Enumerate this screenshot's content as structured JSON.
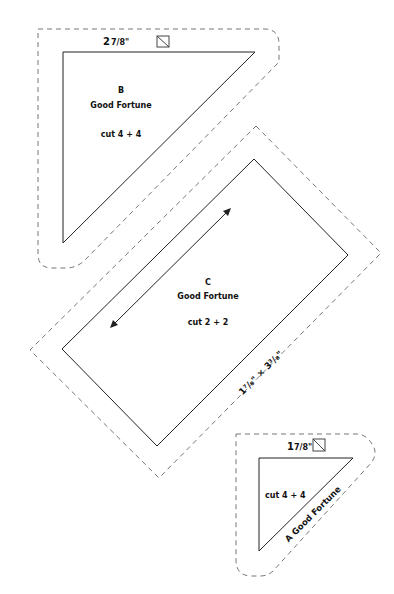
{
  "pieces": {
    "b": {
      "letter": "B",
      "name": "Good Fortune",
      "cut": "cut 4 + 4",
      "size_whole": "2",
      "size_frac": "7/8\"",
      "icon": "half-square-triangle-icon"
    },
    "c": {
      "letter": "C",
      "name": "Good Fortune",
      "cut": "cut 2 + 2",
      "size_label": "1⁷/₈\" × 3³/₈\"",
      "grain_icon": "double-arrow-icon"
    },
    "a": {
      "name": "A Good Fortune",
      "cut": "cut 4 + 4",
      "size_whole": "1",
      "size_frac": "7/8\"",
      "icon": "half-square-triangle-icon"
    }
  },
  "colors": {
    "cut_line": "#222222",
    "seam_line": "#777777",
    "text": "#111111",
    "background": "#ffffff"
  }
}
